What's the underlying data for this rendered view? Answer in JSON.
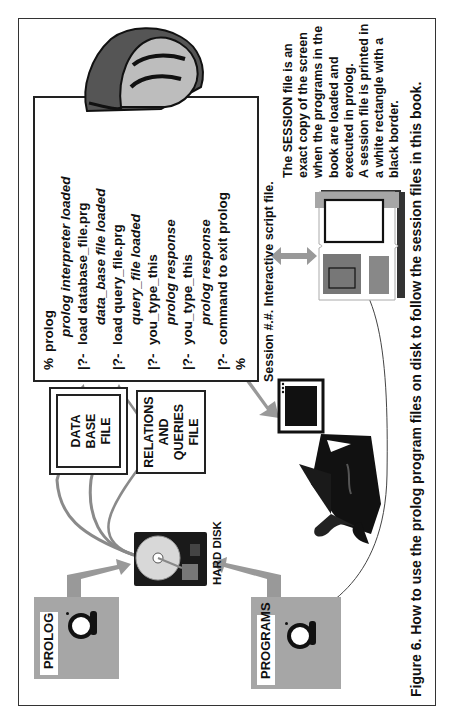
{
  "figure": {
    "caption": "Figure 6.  How to use the prolog program files on disk to follow the session files in this book.",
    "orientation": "rotated-90-ccw"
  },
  "floppies": {
    "prolog": {
      "label": "PROLOG"
    },
    "programs": {
      "label": "PROGRAMS"
    }
  },
  "hard_disk": {
    "label": "HARD DISK"
  },
  "file_boxes": {
    "database": {
      "lines": [
        "DATA",
        "BASE",
        "FILE"
      ]
    },
    "relations": {
      "lines": [
        "RELATIONS",
        "AND",
        "QUERIES",
        "FILE"
      ]
    }
  },
  "terminal": {
    "lines": [
      {
        "prompt": "%",
        "text": "prolog",
        "italic": false
      },
      {
        "prompt": "",
        "text": "prolog interpreter loaded",
        "italic": true
      },
      {
        "prompt": "|?-",
        "text": "load database_file.prg",
        "italic": false
      },
      {
        "prompt": "",
        "text": "data_base file loaded",
        "italic": true
      },
      {
        "prompt": "|?-",
        "text": "load query_file.prg",
        "italic": false
      },
      {
        "prompt": "",
        "text": "query_file loaded",
        "italic": true
      },
      {
        "prompt": "|?-",
        "text": "you_type_this",
        "italic": false
      },
      {
        "prompt": "",
        "text": "prolog response",
        "italic": true
      },
      {
        "prompt": "|?-",
        "text": "you_type_this",
        "italic": false
      },
      {
        "prompt": "",
        "text": "prolog response",
        "italic": true
      },
      {
        "prompt": "|?-",
        "text": "command to exit prolog",
        "italic": false
      },
      {
        "prompt": "%",
        "text": "",
        "italic": false
      }
    ]
  },
  "session": {
    "caption": "Session #.#.  Interactive script file.",
    "description": [
      "The SESSION file is an",
      "exact copy of the screen",
      "when the programs in the",
      "book are loaded and",
      "executed in prolog.",
      "A session file is printed in",
      "a white rectangle with a",
      "black border."
    ]
  },
  "illustrations": {
    "hand": "pointing-hand-icon",
    "person": "person-at-computer-icon",
    "book": "open-book-icon",
    "disk": "hard-disk-icon"
  },
  "colors": {
    "arrow_gray": "#999999",
    "floppy_gray": "#a6a6a6",
    "border": "#222222"
  }
}
